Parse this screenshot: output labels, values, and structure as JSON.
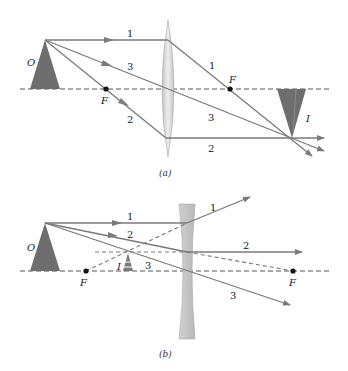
{
  "diagram": {
    "colors": {
      "ray": "#7a7a7a",
      "axis": "#555555",
      "object": "#6e6e6e",
      "lens": "#d6d6d6",
      "lens_edge": "#9a9a9a",
      "focal_point": "#111111"
    },
    "panel_a": {
      "caption": "(a)",
      "type": "converging lens",
      "object_label": "O",
      "image_label": "I",
      "focal_left_label": "F",
      "focal_right_label": "F",
      "ray_labels": {
        "r1_in": "1",
        "r1_out": "1",
        "r2_in": "2",
        "r2_out": "2",
        "r3_in": "3",
        "r3_out": "3"
      }
    },
    "panel_b": {
      "caption": "(b)",
      "type": "diverging lens",
      "object_label": "O",
      "image_label": "I",
      "focal_left_label": "F",
      "focal_right_label": "F",
      "ray_labels": {
        "r1_in": "1",
        "r1_out": "1",
        "r2_in": "2",
        "r2_out": "2",
        "r3_in": "3",
        "r3_out": "3"
      }
    }
  }
}
